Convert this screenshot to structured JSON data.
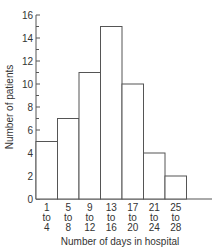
{
  "chart_data": {
    "type": "bar",
    "title": "",
    "xlabel": "Number of days in hospital",
    "ylabel": "Number of patients",
    "categories": [
      "1 to 4",
      "5 to 8",
      "9 to 12",
      "13 to 16",
      "17 to 20",
      "21 to 24",
      "25 to 28"
    ],
    "category_lines": [
      [
        "1",
        "to",
        "4"
      ],
      [
        "5",
        "to",
        "8"
      ],
      [
        "9",
        "to",
        "12"
      ],
      [
        "13",
        "to",
        "16"
      ],
      [
        "17",
        "to",
        "20"
      ],
      [
        "21",
        "to",
        "24"
      ],
      [
        "25",
        "to",
        "28"
      ]
    ],
    "values": [
      5,
      7,
      11,
      15,
      10,
      4,
      2
    ],
    "ylim": [
      0,
      16
    ],
    "y_major_ticks": [
      0,
      2,
      4,
      6,
      8,
      10,
      12,
      14,
      16
    ],
    "y_minor_ticks": [
      1,
      3,
      5,
      7,
      9,
      11,
      13,
      15
    ],
    "grid": false,
    "legend": null,
    "style": "histogram (adjacent bars, outlined, no fill)",
    "colors": {
      "stroke": "#555555",
      "fill": "#ffffff"
    }
  }
}
